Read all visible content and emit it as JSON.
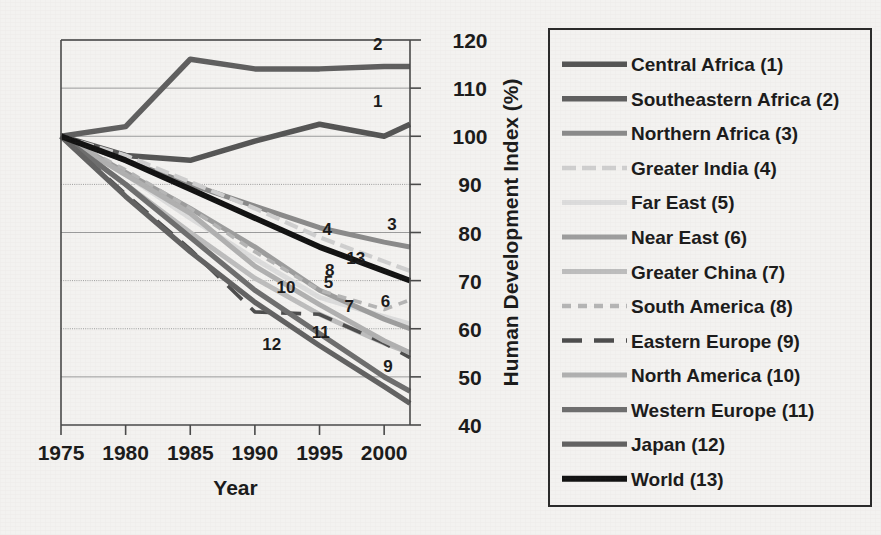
{
  "chart_data": {
    "type": "line",
    "title": "",
    "xlabel": "Year",
    "ylabel": "Human Development Index (%)",
    "xlim": [
      1975,
      2002
    ],
    "ylim": [
      40,
      120
    ],
    "xticks": [
      1975,
      1980,
      1985,
      1990,
      1995,
      2000
    ],
    "xtick_labels": [
      "1975",
      "1980",
      "1985",
      "1990",
      "1995",
      "2000"
    ],
    "yticks": [
      40,
      50,
      60,
      70,
      80,
      90,
      100,
      110,
      120
    ],
    "ytick_labels": [
      "40",
      "50",
      "60",
      "70",
      "80",
      "90",
      "100",
      "110",
      "120"
    ],
    "grid": true,
    "grid_axis": "y",
    "yaxis_position": "right",
    "legend_position": "right-outside",
    "x": [
      1975,
      1980,
      1985,
      1990,
      1995,
      2000,
      2002
    ],
    "series": [
      {
        "id": 1,
        "name": "Central Africa",
        "legend": "Central Africa (1)",
        "values": [
          100,
          96,
          95,
          99,
          102.5,
          100,
          102.5
        ],
        "color": "#555555",
        "width": 5.5,
        "dash": "none",
        "tag": "1",
        "tag_x": 1999.5,
        "tag_y": 106
      },
      {
        "id": 2,
        "name": "Southeastern Africa",
        "legend": "Southeastern Africa (2)",
        "values": [
          100,
          102,
          116,
          114,
          114,
          114.5,
          114.5
        ],
        "color": "#5f5f5f",
        "width": 5.5,
        "dash": "none",
        "tag": "2",
        "tag_x": 1999.5,
        "tag_y": 118
      },
      {
        "id": 3,
        "name": "Northern Africa",
        "legend": "Northern Africa (3)",
        "values": [
          100,
          95,
          90,
          85.5,
          81,
          78,
          77
        ],
        "color": "#8a8a8a",
        "width": 5.0,
        "dash": "none",
        "tag": "3",
        "tag_x": 2000.6,
        "tag_y": 80.5
      },
      {
        "id": 4,
        "name": "Greater India",
        "legend": "Greater India (4)",
        "values": [
          100,
          96,
          90.5,
          85,
          79,
          74,
          72
        ],
        "color": "#cfcfcf",
        "width": 4.2,
        "dash": "14 6",
        "tag": "4",
        "tag_x": 1995.6,
        "tag_y": 79.5
      },
      {
        "id": 5,
        "name": "Far East",
        "legend": "Far East (5)",
        "values": [
          100,
          92,
          83,
          74.5,
          66.5,
          62.5,
          61
        ],
        "color": "#dcdcdc",
        "width": 5.0,
        "dash": "none",
        "tag": "5",
        "tag_x": 1995.7,
        "tag_y": 68.5
      },
      {
        "id": 6,
        "name": "Near East",
        "legend": "Near East (6)",
        "values": [
          100,
          92.5,
          85,
          77,
          68,
          62,
          60
        ],
        "color": "#9d9d9d",
        "width": 5.0,
        "dash": "none",
        "tag": "6",
        "tag_x": 2000.1,
        "tag_y": 64.5
      },
      {
        "id": 7,
        "name": "Greater China",
        "legend": "Greater China (7)",
        "values": [
          100,
          90,
          80,
          70.5,
          63,
          57,
          55
        ],
        "color": "#bdbdbd",
        "width": 5.0,
        "dash": "none",
        "tag": "7",
        "tag_x": 1997.3,
        "tag_y": 63.5
      },
      {
        "id": 8,
        "name": "South America",
        "legend": "South America (8)",
        "values": [
          100,
          93,
          85,
          76,
          68,
          64,
          66
        ],
        "color": "#b5b5b5",
        "width": 3.6,
        "dash": "9 7",
        "tag": "8",
        "tag_x": 1995.8,
        "tag_y": 71
      },
      {
        "id": 9,
        "name": "Eastern Europe",
        "legend": "Eastern Europe (9)",
        "values": [
          100,
          88,
          76.5,
          63.5,
          63,
          57,
          54
        ],
        "color": "#4d4d4d",
        "width": 3.6,
        "dash": "20 12",
        "tag": "9",
        "tag_x": 2000.3,
        "tag_y": 51
      },
      {
        "id": 10,
        "name": "North America",
        "legend": "North America (10)",
        "values": [
          100,
          92,
          84,
          73,
          65,
          57.5,
          55
        ],
        "color": "#b0b0b0",
        "width": 5.0,
        "dash": "none",
        "tag": "10",
        "tag_x": 1992.4,
        "tag_y": 67.5
      },
      {
        "id": 11,
        "name": "Western Europe",
        "legend": "Western Europe (11)",
        "values": [
          100,
          90,
          79,
          68,
          59,
          50,
          47
        ],
        "color": "#6e6e6e",
        "width": 5.2,
        "dash": "none",
        "tag": "11",
        "tag_x": 1995.1,
        "tag_y": 58
      },
      {
        "id": 12,
        "name": "Japan",
        "legend": "Japan (12)",
        "values": [
          100,
          87.5,
          76,
          65.5,
          56.5,
          48,
          44.5
        ],
        "color": "#626262",
        "width": 5.2,
        "dash": "none",
        "tag": "12",
        "tag_x": 1991.3,
        "tag_y": 55.5
      },
      {
        "id": 13,
        "name": "World",
        "legend": "World (13)",
        "values": [
          100,
          95,
          89,
          83,
          77,
          72,
          70
        ],
        "color": "#121212",
        "width": 5.8,
        "dash": "none",
        "tag": "13",
        "tag_x": 1997.8,
        "tag_y": 73.5
      }
    ]
  }
}
